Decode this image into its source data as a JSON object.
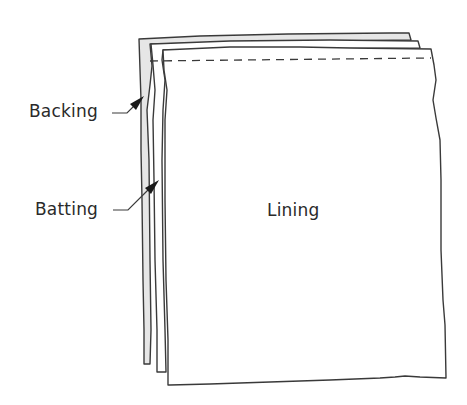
{
  "diagram": {
    "labels": {
      "backing": "Backing",
      "batting": "Batting",
      "lining": "Lining"
    },
    "colors": {
      "outline": "#3a3a3a",
      "backing_fill": "#e6e6e6",
      "batting_fill": "#ffffff",
      "lining_fill": "#ffffff",
      "text": "#2a2a2a"
    },
    "layers": [
      {
        "name": "backing",
        "order": 1,
        "fill": "gray"
      },
      {
        "name": "batting",
        "order": 2,
        "fill": "white"
      },
      {
        "name": "lining",
        "order": 3,
        "fill": "white"
      }
    ],
    "stitch_line": {
      "style": "dashed",
      "position": "top"
    }
  }
}
